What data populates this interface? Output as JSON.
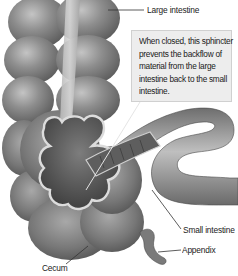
{
  "diagram": {
    "labels": {
      "large_intestine": "Large intestine",
      "small_intestine": "Small intestine",
      "appendix": "Appendix",
      "cecum": "Cecum"
    },
    "callout": {
      "text": "When closed, this sphincter prevents the backflow of material from the large intestine back to the small intestine."
    },
    "colors": {
      "background": "#ffffff",
      "organ_fill": "#8a8a8a",
      "organ_highlight": "#bdbdbd",
      "organ_shadow": "#555555",
      "cutaway_edge": "#d8d8d8",
      "callout_fill": "#ededed",
      "leader_line": "#333333"
    }
  }
}
